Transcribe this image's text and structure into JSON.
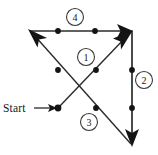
{
  "figure": {
    "background_color": "#ffffff",
    "line_color": "#2b2b2b",
    "node_color": "#141414",
    "text_color": "#161616",
    "width": 158,
    "height": 155
  },
  "labels": {
    "start": "Start"
  },
  "badges": [
    {
      "id": "badge-4",
      "label": "4",
      "cx": 75,
      "cy": 17,
      "r": 8.5
    },
    {
      "id": "badge-1",
      "label": "1",
      "cx": 86,
      "cy": 57,
      "r": 8.5
    },
    {
      "id": "badge-2",
      "label": "2",
      "cx": 144,
      "cy": 80,
      "r": 8.5
    },
    {
      "id": "badge-3",
      "label": "3",
      "cx": 89,
      "cy": 122,
      "r": 8.5
    }
  ],
  "vertices": [
    {
      "id": "top-left",
      "x": 30,
      "y": 31
    },
    {
      "id": "top-right",
      "x": 132,
      "y": 31
    },
    {
      "id": "bottom-right",
      "x": 132,
      "y": 145
    },
    {
      "id": "start-node",
      "x": 58,
      "y": 108
    }
  ],
  "nodes": [
    {
      "id": "node-top-a",
      "x": 58,
      "y": 31,
      "r": 2.9,
      "on_edge": "4"
    },
    {
      "id": "node-top-b",
      "x": 95,
      "y": 31,
      "r": 2.9,
      "on_edge": "4"
    },
    {
      "id": "node-right-upper",
      "x": 132,
      "y": 70,
      "r": 2.9,
      "on_edge": "2"
    },
    {
      "id": "node-right-lower",
      "x": 132,
      "y": 108,
      "r": 2.9,
      "on_edge": "2"
    },
    {
      "id": "node-diag3-upper",
      "x": 58,
      "y": 70,
      "r": 2.9,
      "on_edge": "3"
    },
    {
      "id": "node-diag3-lower",
      "x": 96,
      "y": 108,
      "r": 2.9,
      "on_edge": "3"
    },
    {
      "id": "node-diag1-lower",
      "x": 96,
      "y": 70,
      "r": 2.9,
      "on_edge": "1"
    },
    {
      "id": "node-start",
      "x": 58,
      "y": 108,
      "r": 3.4,
      "on_edge": "1"
    }
  ],
  "edges": [
    {
      "id": "edge-1",
      "number": "1",
      "from": "start-node",
      "to": "top-right",
      "x1": 58,
      "y1": 108,
      "x2": 130,
      "y2": 33,
      "arrow_at": "end",
      "description": "diagonal up-right from Start to top-right vertex"
    },
    {
      "id": "edge-2",
      "number": "2",
      "from": "top-right",
      "to": "bottom-right",
      "x1": 132,
      "y1": 31,
      "x2": 132,
      "y2": 143,
      "arrow_at": "end",
      "description": "vertical down the right side"
    },
    {
      "id": "edge-3",
      "number": "3",
      "from": "bottom-right",
      "to": "top-left",
      "x1": 132,
      "y1": 145,
      "x2": 32,
      "y2": 33,
      "arrow_at": "end",
      "description": "diagonal up-left from bottom-right to top-left vertex"
    },
    {
      "id": "edge-4",
      "number": "4",
      "from": "top-left",
      "to": "top-right",
      "x1": 30,
      "y1": 31,
      "x2": 130,
      "y2": 31,
      "arrow_at": "end",
      "description": "horizontal right along the top"
    }
  ],
  "start_marker": {
    "text": "Start",
    "text_x": 3,
    "text_y": 108,
    "line_x1": 34,
    "line_x2": 52,
    "line_y": 108,
    "arrow_tip_x": 56
  }
}
